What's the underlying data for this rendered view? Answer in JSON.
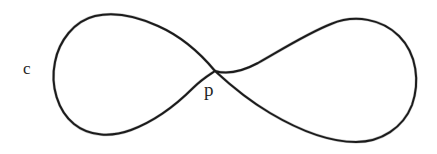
{
  "figure": {
    "kind": "hand-drawn-diagram",
    "background_color": "#ffffff",
    "stroke_color": "#1b1b1b",
    "width": 437,
    "height": 154
  },
  "labels": {
    "curve_label": "c",
    "node_label": "p"
  },
  "geometry": {
    "curve_name": "figure-eight",
    "self_intersection_point": {
      "x": 215,
      "y": 71
    },
    "left_lobe": {
      "leftmost": {
        "x": 54,
        "y": 76
      },
      "top": {
        "x": 106,
        "y": 14
      },
      "bottom": {
        "x": 112,
        "y": 134
      }
    },
    "right_lobe": {
      "rightmost": {
        "x": 419,
        "y": 84
      },
      "top": {
        "x": 355,
        "y": 19
      },
      "bottom": {
        "x": 342,
        "y": 141
      }
    },
    "left_lobe_path": "M 215 71 C 196 48 176 34 158 26 C 134 15 112 12 95 16 C 74 21 59 41 55 62 C 50 86 58 111 74 124 C 90 137 112 137 131 130 C 155 121 176 105 193 88 C 202 79 209 75 215 71 Z",
    "right_lobe_path": "M 215 71 C 228 75 243 71 258 63 C 281 50 308 33 331 24 C 355 14 382 19 399 36 C 417 54 420 82 412 105 C 403 128 381 142 356 142 C 328 142 297 129 270 113 C 248 100 228 83 215 71 Z"
  }
}
